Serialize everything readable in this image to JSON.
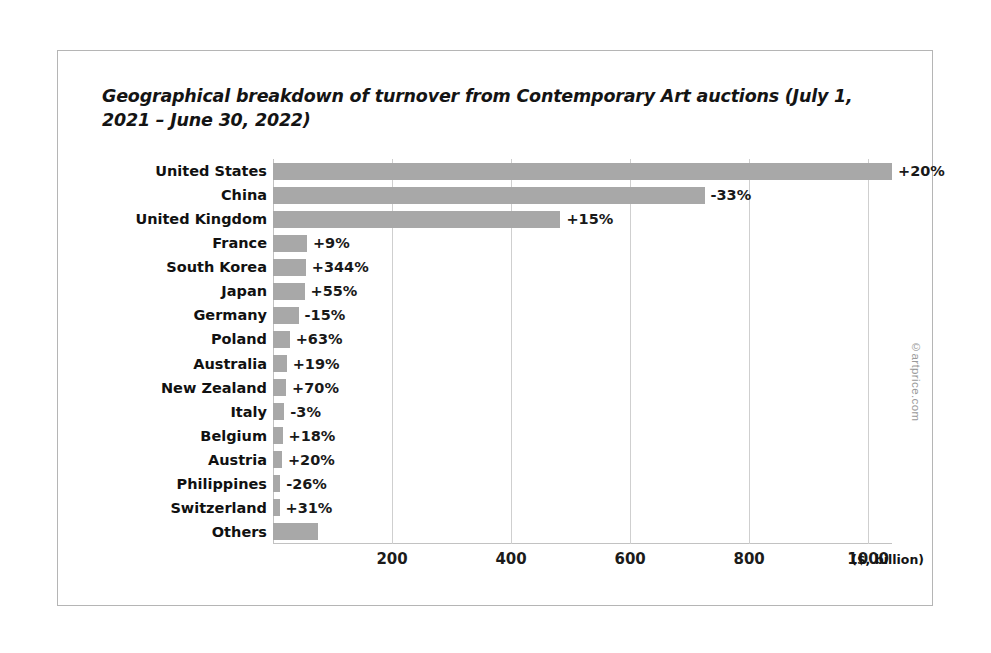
{
  "figure": {
    "watermark": "©artprice.com",
    "unit_label": "($, billion)",
    "border_color": "#b5b5b5",
    "bar_color": "#a8a8a8",
    "grid_color": "#cfcfcf"
  },
  "chart_data": {
    "type": "bar",
    "orientation": "horizontal",
    "title": "Geographical breakdown of turnover from Contemporary Art auctions (July 1, 2021 – June 30, 2022)",
    "xlabel": "($, billion)",
    "ylabel": "",
    "xlim": [
      0,
      1040
    ],
    "xticks": [
      200,
      400,
      600,
      800,
      1000
    ],
    "xtick_labels": [
      "200",
      "400",
      "600",
      "800",
      "1000"
    ],
    "grid": true,
    "legend": false,
    "categories": [
      "United States",
      "China",
      "United Kingdom",
      "France",
      "South Korea",
      "Japan",
      "Germany",
      "Poland",
      "Australia",
      "New Zealand",
      "Italy",
      "Belgium",
      "Austria",
      "Philippines",
      "Switzerland",
      "Others"
    ],
    "values": [
      1040,
      725,
      483,
      57,
      55,
      53,
      43,
      28,
      23,
      22,
      19,
      16,
      15,
      12,
      11,
      75
    ],
    "annotations": [
      "+20%",
      "-33%",
      "+15%",
      "+9%",
      "+344%",
      "+55%",
      "-15%",
      "+63%",
      "+19%",
      "+70%",
      "-3%",
      "+18%",
      "+20%",
      "-26%",
      "+31%",
      ""
    ]
  }
}
